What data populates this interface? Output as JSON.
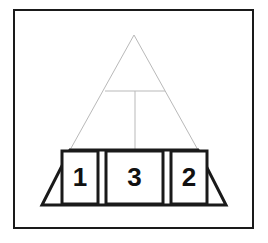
{
  "figure": {
    "name": "pyramid-diagram",
    "background_color": "#ffffff",
    "frame": {
      "name": "outer-frame",
      "stroke_color": "#1a1a1a",
      "fill_color": "#ffffff",
      "x": 14,
      "y": 10,
      "width": 239,
      "height": 218,
      "stroke_width": 2
    },
    "upper_triangle": {
      "name": "pyramid-upper-outline",
      "stroke_color": "#b9b9b9",
      "fill_color": "#ffffff",
      "stroke_width": 1,
      "apex_x": 134,
      "apex_y": 35,
      "base_left_x": 70,
      "base_right_x": 198,
      "base_y": 150
    },
    "divider_horizontal": {
      "name": "tier-divider-line",
      "stroke_color": "#b9b9b9",
      "stroke_width": 1,
      "x1": 105,
      "y1": 91,
      "x2": 165,
      "y2": 91
    },
    "divider_vertical": {
      "name": "center-drop-line",
      "stroke_color": "#b9b9b9",
      "stroke_width": 1,
      "x1": 135,
      "y1": 91,
      "x2": 135,
      "y2": 150
    },
    "base_trapezoid": {
      "name": "pyramid-base-trapezoid",
      "stroke_color": "#1a1a1a",
      "fill_color": "#ffffff",
      "stroke_width": 3,
      "top_left_x": 70,
      "top_right_x": 198,
      "top_y": 150,
      "bottom_left_x": 42,
      "bottom_right_x": 226,
      "bottom_y": 205
    },
    "cells": [
      {
        "name": "base-cell-1",
        "label": "1",
        "x": 62,
        "y": 151,
        "width": 36,
        "height": 53,
        "stroke_color": "#1a1a1a",
        "fill_color": "#ffffff",
        "stroke_width": 3
      },
      {
        "name": "base-cell-3",
        "label": "3",
        "x": 106,
        "y": 151,
        "width": 57,
        "height": 53,
        "stroke_color": "#1a1a1a",
        "fill_color": "#ffffff",
        "stroke_width": 3
      },
      {
        "name": "base-cell-2",
        "label": "2",
        "x": 171,
        "y": 151,
        "width": 36,
        "height": 53,
        "stroke_color": "#1a1a1a",
        "fill_color": "#ffffff",
        "stroke_width": 3
      }
    ]
  }
}
